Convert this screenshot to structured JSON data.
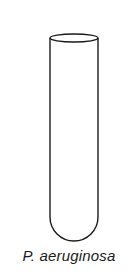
{
  "figure": {
    "label": "P. aeruginosa",
    "stroke_color": "#1a1a1a",
    "background": "#ffffff"
  }
}
